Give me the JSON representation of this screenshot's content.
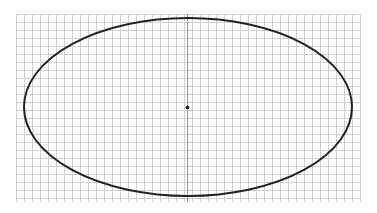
{
  "figure": {
    "grid": {
      "x_start": 16,
      "x_end": 360,
      "y_start": 14,
      "y_end": 202,
      "spacing": 8,
      "line_color": "#cfcfcf",
      "axis_color": "#9a9a9a"
    },
    "ellipse": {
      "cx": 188,
      "cy": 107,
      "rx": 164,
      "ry": 89,
      "stroke_color": "#222222",
      "stroke_width": 2
    },
    "center_point": {
      "x": 187,
      "y": 107,
      "r": 1.8,
      "color": "#111111"
    }
  }
}
